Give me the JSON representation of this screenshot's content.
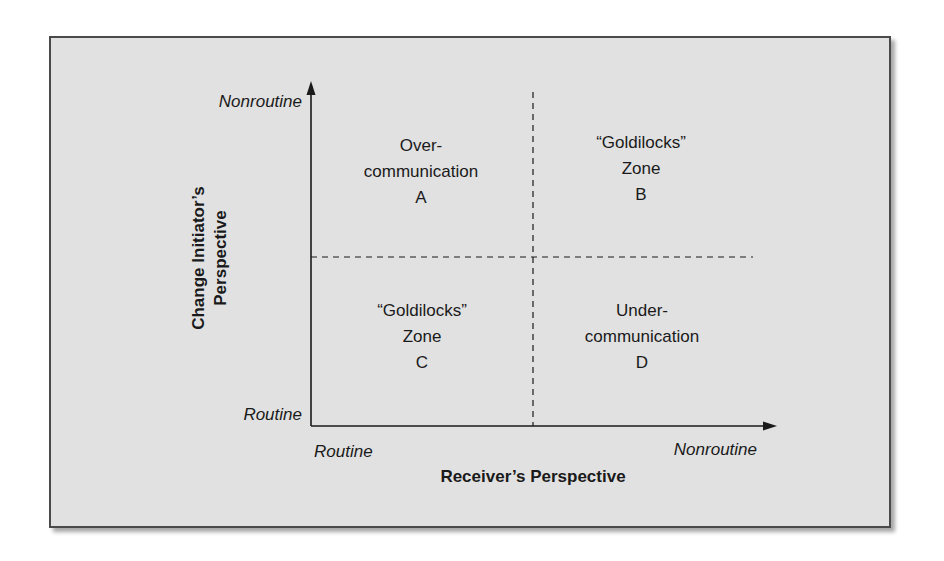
{
  "diagram": {
    "type": "2x2 quadrant matrix",
    "y_axis": {
      "title_line1": "Change Initiator’s",
      "title_line2": "Perspective",
      "high_label": "Nonroutine",
      "low_label": "Routine"
    },
    "x_axis": {
      "title": "Receiver’s Perspective",
      "low_label": "Routine",
      "high_label": "Nonroutine"
    },
    "quadrants": {
      "a": {
        "position": "top-left",
        "line1": "Over-",
        "line2": "communication",
        "letter": "A"
      },
      "b": {
        "position": "top-right",
        "line1": "“Goldilocks”",
        "line2": "Zone",
        "letter": "B"
      },
      "c": {
        "position": "bottom-left",
        "line1": "“Goldilocks”",
        "line2": "Zone",
        "letter": "C"
      },
      "d": {
        "position": "bottom-right",
        "line1": "Under-",
        "line2": "communication",
        "letter": "D"
      }
    },
    "colors": {
      "background": "#e1e1e1",
      "border": "#4a4a4a",
      "lines": "#1a1a1a"
    }
  }
}
